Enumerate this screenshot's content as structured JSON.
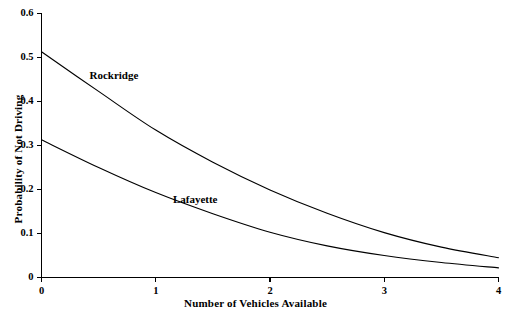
{
  "chart_data": {
    "type": "line",
    "title": "",
    "xlabel": "Number of Vehicles Available",
    "ylabel": "Probability of Not Driving",
    "xlim": [
      0,
      4
    ],
    "ylim": [
      0,
      0.6
    ],
    "grid": false,
    "legend_position": "inline-annotation",
    "xticks": [
      "0",
      "1",
      "2",
      "3",
      "4"
    ],
    "xtick_values": [
      0,
      1,
      2,
      3,
      4
    ],
    "yticks": [
      "0",
      "0.1",
      "0.2",
      "0.3",
      "0.4",
      "0.5",
      "0.6"
    ],
    "ytick_values": [
      0,
      0.1,
      0.2,
      0.3,
      0.4,
      0.5,
      0.6
    ],
    "x": [
      0,
      0.5,
      1,
      1.5,
      2,
      2.5,
      3,
      3.5,
      4
    ],
    "series": [
      {
        "name": "Rockridge",
        "values": [
          0.513,
          0.423,
          0.335,
          0.262,
          0.199,
          0.146,
          0.102,
          0.069,
          0.045
        ]
      },
      {
        "name": "Lafayette",
        "values": [
          0.313,
          0.25,
          0.193,
          0.145,
          0.103,
          0.072,
          0.05,
          0.034,
          0.022
        ]
      }
    ],
    "annotations": [
      {
        "text": "Rockridge",
        "x": 0.42,
        "y": 0.455
      },
      {
        "text": "Lafayette",
        "x": 1.15,
        "y": 0.175
      }
    ],
    "line_color": "#000000",
    "axis_color": "#000000",
    "background_color": "#ffffff"
  }
}
